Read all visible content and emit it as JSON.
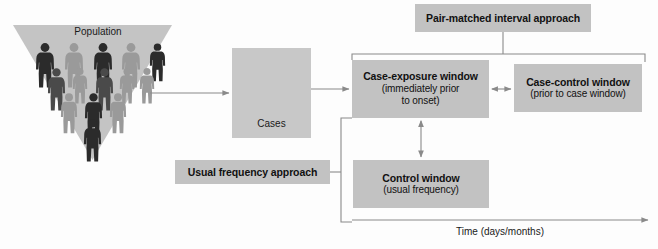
{
  "figure": {
    "type": "epidemiology-study-design-diagram",
    "colors": {
      "box_fill": "#c2c2c2",
      "panel_fill": "#c8c8c8",
      "triangle_fill": "#c4c4c4",
      "line": "#8a8a8a",
      "text": "#111111",
      "figure_person_dark": "#2b2b2b",
      "figure_person_mid": "#6e6e6e",
      "figure_person_light": "#9a9a9a"
    }
  },
  "population": {
    "label": "Population",
    "shape": "inverted-triangle",
    "person_rows": [
      5,
      5,
      3,
      1
    ]
  },
  "cases": {
    "label": "Cases",
    "shape": "rectangle-panel",
    "person_count": 5
  },
  "boxes": {
    "pair_matched": {
      "title": "Pair-matched interval approach",
      "subtitle": ""
    },
    "case_exposure": {
      "title": "Case-exposure window",
      "subtitle_line1": "(immediately prior",
      "subtitle_line2": "to onset)"
    },
    "case_control": {
      "title": "Case-control window",
      "subtitle_line1": "(prior to case window)"
    },
    "control": {
      "title": "Control window",
      "subtitle_line1": "(usual frequency)"
    },
    "usual_frequency": {
      "title": "Usual frequency approach"
    }
  },
  "axis": {
    "time_label": "Time (days/months)",
    "direction": "left-to-right"
  },
  "connectors": [
    {
      "name": "population-to-cases",
      "style": "single-arrow-right"
    },
    {
      "name": "cases-to-case-exposure",
      "style": "single-arrow-right"
    },
    {
      "name": "case-exposure-to-case-control",
      "style": "double-arrow-horizontal"
    },
    {
      "name": "case-exposure-to-control",
      "style": "double-arrow-vertical"
    },
    {
      "name": "pair-matched-bracket",
      "style": "bracket-down-spanning-two-boxes"
    },
    {
      "name": "usual-frequency-bracket",
      "style": "bracket-right-spanning-control-and-time"
    }
  ]
}
